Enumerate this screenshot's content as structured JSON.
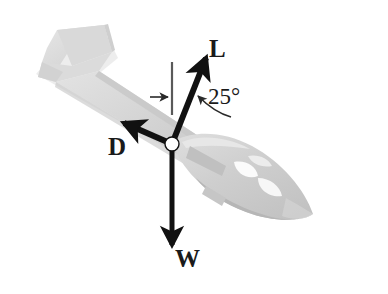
{
  "figure": {
    "name": "glider-free-body-diagram",
    "background_color": "#ffffff",
    "aircraft": {
      "name": "glider-sailplane",
      "body_fill": "#d4d4d4",
      "body_fill_light": "#e2e2e2",
      "body_fill_dark": "#bdbdbd",
      "highlight_fill": "#fbfbfb",
      "shadow_fill": "#c9c9c9"
    },
    "origin_marker": {
      "name": "force-origin-point",
      "fill": "#ffffff",
      "stroke": "#1a1a1a",
      "cx": 172,
      "cy": 144,
      "r": 7
    },
    "vectors": [
      {
        "id": "lift",
        "label": "L",
        "name": "lift-vector",
        "color": "#111111",
        "x1": 172,
        "y1": 144,
        "x2": 206,
        "y2": 57,
        "width": 6,
        "description": "Lift force, perpendicular to flight path, 25 degrees from vertical"
      },
      {
        "id": "drag",
        "label": "D",
        "name": "drag-vector",
        "color": "#111111",
        "x1": 172,
        "y1": 144,
        "x2": 122,
        "y2": 122,
        "width": 6,
        "description": "Drag force, opposite to direction of motion"
      },
      {
        "id": "weight",
        "label": "W",
        "name": "weight-vector",
        "color": "#111111",
        "x1": 172,
        "y1": 144,
        "x2": 172,
        "y2": 247,
        "width": 5,
        "description": "Weight force, vertically downward"
      }
    ],
    "annotations": {
      "angle": {
        "name": "angle-annotation",
        "value": "25",
        "unit": "°",
        "text": "25°",
        "measured_from": "vertical-reference-line",
        "measured_to": "lift-vector"
      },
      "vertical_reference": {
        "name": "vertical-reference-line",
        "color": "#555555",
        "x": 172,
        "y1": 62,
        "y2": 115,
        "width": 2
      },
      "tick_arrow": {
        "name": "vertical-reference-tick-arrow",
        "color": "#2a2a2a",
        "x1": 150,
        "y1": 97,
        "x2": 169,
        "y2": 97,
        "description": "small arrow pointing right at the vertical reference line"
      },
      "angle_leader": {
        "name": "angle-leader-arrow",
        "color": "#2a2a2a",
        "from_x": 229,
        "from_y": 116,
        "to_x": 196,
        "to_y": 95,
        "description": "curved leader from the 25 degree label to the angle region"
      }
    }
  }
}
